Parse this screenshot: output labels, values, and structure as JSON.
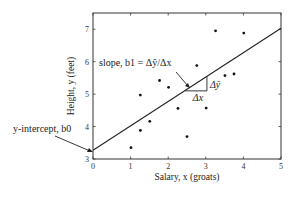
{
  "chart_data": {
    "type": "scatter",
    "title": "",
    "xlabel": "Salary, x (groats)",
    "ylabel": "Height, y (feet)",
    "xlim": [
      0,
      5
    ],
    "ylim": [
      3,
      7.5
    ],
    "x_ticks": [
      0,
      1,
      2,
      3,
      4,
      5
    ],
    "y_ticks": [
      3,
      4,
      5,
      6,
      7
    ],
    "x_tick_labels": [
      "0",
      "1",
      "2",
      "3",
      "4",
      "5"
    ],
    "y_tick_labels": [
      "3",
      "4",
      "5",
      "6",
      "7"
    ],
    "grid": false,
    "legend": null,
    "series": [
      {
        "name": "observations",
        "type": "scatter",
        "points": [
          {
            "x": 1.01,
            "y": 3.35
          },
          {
            "x": 1.26,
            "y": 3.88
          },
          {
            "x": 1.51,
            "y": 4.16
          },
          {
            "x": 1.26,
            "y": 4.97
          },
          {
            "x": 1.77,
            "y": 5.42
          },
          {
            "x": 2.01,
            "y": 5.21
          },
          {
            "x": 2.26,
            "y": 4.56
          },
          {
            "x": 2.5,
            "y": 3.69
          },
          {
            "x": 2.76,
            "y": 5.88
          },
          {
            "x": 3.01,
            "y": 4.57
          },
          {
            "x": 3.51,
            "y": 5.57
          },
          {
            "x": 3.75,
            "y": 5.62
          },
          {
            "x": 3.26,
            "y": 6.95
          },
          {
            "x": 4.01,
            "y": 6.88
          }
        ]
      },
      {
        "name": "regression line",
        "type": "line",
        "points": [
          {
            "x": 0,
            "y": 3.27
          },
          {
            "x": 5,
            "y": 7.03
          }
        ],
        "intercept_b0": 3.27,
        "slope_b1": 0.75
      }
    ],
    "annotations": [
      {
        "text": "slope, b1 = Δŷ/Δx",
        "arrow_to": {
          "x": 2.55,
          "y": 5.2
        }
      },
      {
        "text": "y-intercept, b0",
        "arrow_to": {
          "x": 0,
          "y": 3.27
        }
      },
      {
        "text": "Δx",
        "type": "triangle-base",
        "from_x": 2.45,
        "to_x": 3.03,
        "y": 5.1
      },
      {
        "text": "Δŷ",
        "type": "triangle-height",
        "x": 3.03,
        "from_y": 5.1,
        "to_y": 5.53
      }
    ]
  }
}
